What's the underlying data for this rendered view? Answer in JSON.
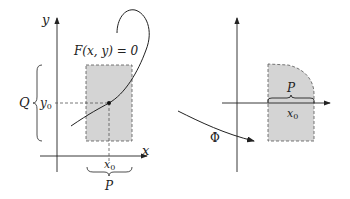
{
  "left_panel": {
    "axis_x_label": "x",
    "axis_y_label": "y",
    "equation": "F(x, y) = 0",
    "x0_label": "x",
    "x0_sub": "0",
    "y0_label": "y",
    "y0_sub": "0",
    "P_label": "P",
    "Q_label": "Q"
  },
  "right_panel": {
    "P_label": "P",
    "x0_label": "x",
    "x0_sub": "0",
    "map_label": "Φ"
  },
  "colors": {
    "line": "#222222",
    "fill": "#d4d4d4",
    "dash": "#555555"
  }
}
